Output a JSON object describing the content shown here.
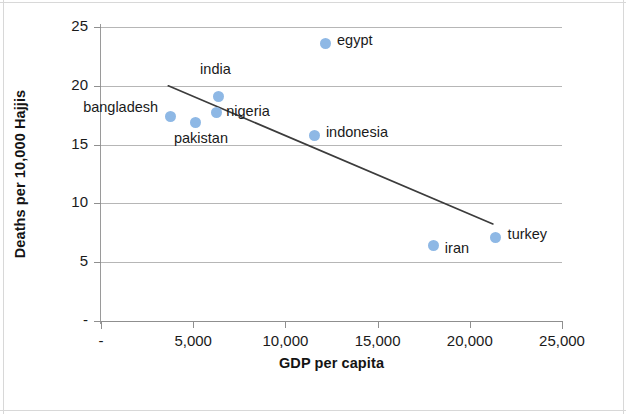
{
  "chart_data": {
    "type": "scatter",
    "title": "",
    "xlabel": "GDP per capita",
    "ylabel": "Deaths per 10,000 Hajjis",
    "xlim": [
      0,
      25000
    ],
    "ylim": [
      0,
      25
    ],
    "grid": true,
    "legend": "none",
    "x_ticks": [
      {
        "value": 0,
        "label": "-"
      },
      {
        "value": 5000,
        "label": "5,000"
      },
      {
        "value": 10000,
        "label": "10,000"
      },
      {
        "value": 15000,
        "label": "15,000"
      },
      {
        "value": 20000,
        "label": "20,000"
      },
      {
        "value": 25000,
        "label": "25,000"
      }
    ],
    "y_ticks": [
      {
        "value": 0,
        "label": "-"
      },
      {
        "value": 5,
        "label": "5"
      },
      {
        "value": 10,
        "label": "10"
      },
      {
        "value": 15,
        "label": "15"
      },
      {
        "value": 20,
        "label": "20"
      },
      {
        "value": 25,
        "label": "25"
      }
    ],
    "marker_color": "#8eb8e5",
    "trendline_color": "#3c3c3c",
    "points": [
      {
        "name": "bangladesh",
        "x": 3750,
        "y": 17.4,
        "label": "bangladesh",
        "label_pos": "left"
      },
      {
        "name": "pakistan",
        "x": 5150,
        "y": 16.9,
        "label": "pakistan",
        "label_pos": "below"
      },
      {
        "name": "nigeria",
        "x": 6250,
        "y": 17.7,
        "label": "nigeria",
        "label_pos": "right"
      },
      {
        "name": "india",
        "x": 6350,
        "y": 19.1,
        "label": "india",
        "label_pos": "above"
      },
      {
        "name": "egypt",
        "x": 12150,
        "y": 23.6,
        "label": "egypt",
        "label_pos": "right"
      },
      {
        "name": "indonesia",
        "x": 11600,
        "y": 15.8,
        "label": "indonesia",
        "label_pos": "right"
      },
      {
        "name": "iran",
        "x": 18050,
        "y": 6.4,
        "label": "iran",
        "label_pos": "right"
      },
      {
        "name": "turkey",
        "x": 21400,
        "y": 7.1,
        "label": "turkey",
        "label_pos": "right"
      }
    ],
    "trendline": {
      "x_start": 3650,
      "y_start": 20.0,
      "x_end": 21250,
      "y_end": 8.25
    }
  },
  "labels": {
    "bangladesh": "bangladesh",
    "pakistan": "pakistan",
    "nigeria": "nigeria",
    "india": "india",
    "egypt": "egypt",
    "indonesia": "indonesia",
    "iran": "iran",
    "turkey": "turkey"
  },
  "axis": {
    "y_title": "Deaths per 10,000 Hajjis",
    "x_title": "GDP per capita",
    "y_0": "-",
    "y_5": "5",
    "y_10": "10",
    "y_15": "15",
    "y_20": "20",
    "y_25": "25",
    "x_0": "-",
    "x_5000": "5,000",
    "x_10000": "10,000",
    "x_15000": "15,000",
    "x_20000": "20,000",
    "x_25000": "25,000"
  }
}
